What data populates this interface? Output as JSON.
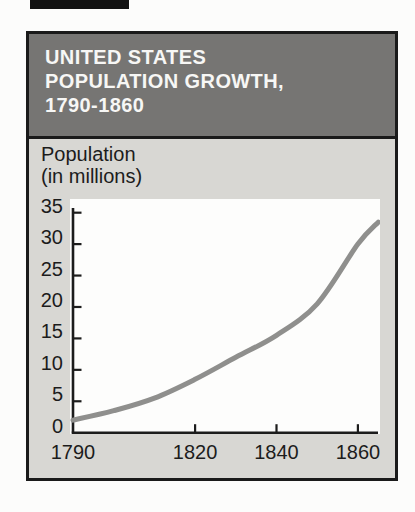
{
  "scan_artifact": {
    "note": "black bar fragment at top edge of scanned page",
    "color": "#121212"
  },
  "card": {
    "header": {
      "title_lines": [
        "UNITED STATES",
        "POPULATION GROWTH,",
        "1790-1860"
      ],
      "bg_color": "#767573",
      "text_color": "#f7f7f5"
    },
    "body_bg_color": "#d8d7d3",
    "border_color": "#1a1a1a"
  },
  "axis_title": {
    "line1": "Population",
    "line2": "(in millions)"
  },
  "chart_data": {
    "type": "line",
    "title": "UNITED STATES POPULATION GROWTH, 1790-1860",
    "xlabel": "",
    "ylabel": "Population (in millions)",
    "x": [
      1790,
      1800,
      1810,
      1820,
      1830,
      1840,
      1850,
      1860,
      1865
    ],
    "values": [
      2,
      3.5,
      5.5,
      8.5,
      12,
      15.5,
      20.5,
      30,
      33.5
    ],
    "series_name": "U.S. population in millions",
    "xlim": [
      1790,
      1866
    ],
    "ylim": [
      0,
      35
    ],
    "y_ticks": [
      0,
      5,
      10,
      15,
      20,
      25,
      30,
      35
    ],
    "x_tick_labels": [
      1790,
      1820,
      1840,
      1860
    ],
    "grid": false,
    "legend_position": "none",
    "plot_bg_color": "#fdfdfc",
    "line_color": "#8f8f8d",
    "axis_color": "#1c1c1c"
  }
}
